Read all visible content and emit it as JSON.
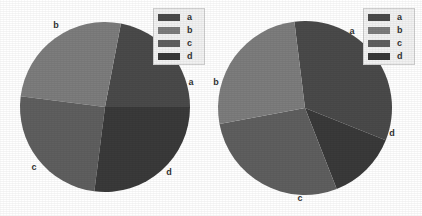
{
  "figure": {
    "background": "#ffffff",
    "width": 422,
    "height": 216
  },
  "palette": {
    "a": "#4a4a4a",
    "b": "#7d7d7d",
    "c": "#5f5f5f",
    "d": "#3a3a3a",
    "legend_bg": "#f2f2f2",
    "legend_border": "#cfcfcf",
    "label_color": "#333333"
  },
  "legend": {
    "entries": [
      {
        "key": "a",
        "label": "a",
        "color": "#4a4a4a"
      },
      {
        "key": "b",
        "label": "b",
        "color": "#7d7d7d"
      },
      {
        "key": "c",
        "label": "c",
        "color": "#5f5f5f"
      },
      {
        "key": "d",
        "label": "d",
        "color": "#3a3a3a"
      }
    ]
  },
  "charts": [
    {
      "id": "pie-left",
      "center_x": 105,
      "center_y": 107,
      "radius": 85,
      "start_angle_deg": 0,
      "direction": "counterclockwise",
      "slices": [
        {
          "label": "a",
          "value": 22,
          "color": "#4a4a4a",
          "label_x": 191,
          "label_y": 82
        },
        {
          "label": "b",
          "value": 26,
          "color": "#7d7d7d",
          "label_x": 56,
          "label_y": 25
        },
        {
          "label": "c",
          "value": 25,
          "color": "#5f5f5f",
          "label_x": 34,
          "label_y": 167
        },
        {
          "label": "d",
          "value": 27,
          "color": "#3a3a3a",
          "label_x": 169,
          "label_y": 172
        }
      ],
      "legend_box": {
        "x": 153,
        "y": 8,
        "width": 52,
        "height": 57
      }
    },
    {
      "id": "pie-right",
      "center_x": 305,
      "center_y": 108,
      "radius": 87,
      "start_angle_deg": 97,
      "direction": "clockwise",
      "slices": [
        {
          "label": "a",
          "value": 33,
          "color": "#4a4a4a",
          "label_x": 352,
          "label_y": 31
        },
        {
          "label": "d",
          "value": 13,
          "color": "#3a3a3a",
          "label_x": 392,
          "label_y": 133
        },
        {
          "label": "c",
          "value": 28,
          "color": "#5f5f5f",
          "label_x": 300,
          "label_y": 198
        },
        {
          "label": "b",
          "value": 26,
          "color": "#7d7d7d",
          "label_x": 216,
          "label_y": 82
        }
      ],
      "legend_box": {
        "x": 363,
        "y": 8,
        "width": 52,
        "height": 57
      }
    }
  ],
  "chart_data": {
    "type": "pie",
    "title": "",
    "n_panels": 2,
    "legend_position": "upper-right",
    "legend_entries": [
      "a",
      "b",
      "c",
      "d"
    ],
    "categories": [
      "a",
      "b",
      "c",
      "d"
    ],
    "panels": [
      {
        "name": "left",
        "categories": [
          "a",
          "b",
          "c",
          "d"
        ],
        "values": [
          22,
          26,
          25,
          27
        ],
        "units": "percent",
        "start_angle_deg": 0,
        "direction": "counterclockwise"
      },
      {
        "name": "right",
        "categories": [
          "a",
          "b",
          "c",
          "d"
        ],
        "values": [
          33,
          26,
          28,
          13
        ],
        "units": "percent",
        "start_angle_deg": 97,
        "direction": "clockwise"
      }
    ],
    "colors": {
      "a": "#4a4a4a",
      "b": "#7d7d7d",
      "c": "#5f5f5f",
      "d": "#3a3a3a"
    },
    "grid": false,
    "xlabel": "",
    "ylabel": ""
  }
}
